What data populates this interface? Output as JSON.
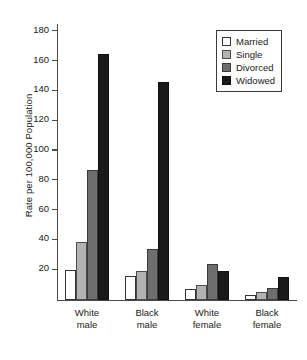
{
  "chart_data": {
    "type": "bar",
    "title": "",
    "subtitle": "",
    "xlabel": "",
    "ylabel": "Rate per 100,000 Population",
    "categories": [
      "White\nmale",
      "Black\nmale",
      "White\nfemale",
      "Black\nfemale"
    ],
    "category_lines": [
      [
        "White",
        "male"
      ],
      [
        "Black",
        "male"
      ],
      [
        "White",
        "female"
      ],
      [
        "Black",
        "female"
      ]
    ],
    "series": [
      {
        "name": "Married",
        "color": "#ffffff",
        "values": [
          20,
          16,
          7,
          3
        ]
      },
      {
        "name": "Single",
        "color": "#b2b2b2",
        "values": [
          39,
          19,
          10,
          5
        ]
      },
      {
        "name": "Divorced",
        "color": "#6e6e6e",
        "values": [
          87,
          34,
          24,
          8
        ]
      },
      {
        "name": "Widowed",
        "color": "#1a1a1a",
        "values": [
          165,
          146,
          19,
          15
        ]
      }
    ],
    "ylim": [
      0,
      185
    ],
    "yticks": [
      20,
      40,
      60,
      80,
      100,
      120,
      140,
      160,
      180
    ],
    "ytick_labels": [
      "20",
      "40",
      "60",
      "80",
      "100",
      "120",
      "140",
      "160",
      "180"
    ],
    "grid": false,
    "legend_position": "top-right",
    "legend_entries": [
      "Married",
      "Single",
      "Divorced",
      "Widowed"
    ]
  }
}
